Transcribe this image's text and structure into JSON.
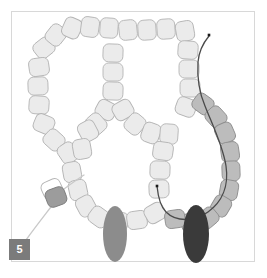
{
  "figure": {
    "step_label": "5",
    "canvas": {
      "width": 267,
      "height": 278
    },
    "frame": {
      "name": "panel-border",
      "x": 11,
      "y": 11,
      "width": 244,
      "height": 251,
      "stroke": "#d8d8d8",
      "fill": "#ffffff"
    },
    "colors": {
      "background": "#ffffff",
      "bead_light_fill": "#ebebeb",
      "bead_light_stroke": "#b4b4b4",
      "bead_medium_fill": "#bcbcbc",
      "bead_medium_stroke": "#8f8f8f",
      "bead_accent_fill": "#9c9c9c",
      "bead_accent_stroke": "#7d7d7d",
      "oval_light_fill": "#8c8c8c",
      "oval_dark_fill": "#3a3a3a",
      "thread_dark": "#4a4a4a",
      "thread_light": "#c9c9c9",
      "needle_tip": "#1a1a1a",
      "badge_background": "#7b7b7b",
      "badge_text": "#ffffff",
      "frame_border": "#d8d8d8"
    },
    "beads_light": [
      {
        "cx": 44,
        "cy": 48,
        "rx": 10,
        "ry": 9,
        "rot": -38
      },
      {
        "cx": 39,
        "cy": 67,
        "rx": 10,
        "ry": 9,
        "rot": -8
      },
      {
        "cx": 38,
        "cy": 86,
        "rx": 10,
        "ry": 9,
        "rot": -2
      },
      {
        "cx": 39,
        "cy": 105,
        "rx": 10,
        "ry": 9,
        "rot": 4
      },
      {
        "cx": 44,
        "cy": 124,
        "rx": 10,
        "ry": 9,
        "rot": 22
      },
      {
        "cx": 54,
        "cy": 140,
        "rx": 10,
        "ry": 9,
        "rot": 42
      },
      {
        "cx": 68,
        "cy": 153,
        "rx": 10,
        "ry": 9,
        "rot": 56
      },
      {
        "cx": 72,
        "cy": 172,
        "rx": 10,
        "ry": 9,
        "rot": 80
      },
      {
        "cx": 78,
        "cy": 190,
        "rx": 10,
        "ry": 9,
        "rot": 78
      },
      {
        "cx": 86,
        "cy": 206,
        "rx": 10,
        "ry": 9,
        "rot": 62
      },
      {
        "cx": 99,
        "cy": 217,
        "rx": 10,
        "ry": 9,
        "rot": 36
      },
      {
        "cx": 118,
        "cy": 221,
        "rx": 10,
        "ry": 9,
        "rot": 8
      },
      {
        "cx": 137,
        "cy": 220,
        "rx": 10,
        "ry": 9,
        "rot": -8
      },
      {
        "cx": 155,
        "cy": 213,
        "rx": 10,
        "ry": 9,
        "rot": -30
      },
      {
        "cx": 56,
        "cy": 35,
        "rx": 10,
        "ry": 9,
        "rot": -52
      },
      {
        "cx": 72,
        "cy": 28,
        "rx": 10,
        "ry": 9,
        "rot": -66
      },
      {
        "cx": 90,
        "cy": 27,
        "rx": 10,
        "ry": 9,
        "rot": -82
      },
      {
        "cx": 109,
        "cy": 28,
        "rx": 10,
        "ry": 9,
        "rot": -86
      },
      {
        "cx": 128,
        "cy": 30,
        "rx": 10,
        "ry": 9,
        "rot": 84
      },
      {
        "cx": 147,
        "cy": 30,
        "rx": 10,
        "ry": 9,
        "rot": 86
      },
      {
        "cx": 166,
        "cy": 29,
        "rx": 10,
        "ry": 9,
        "rot": 86
      },
      {
        "cx": 185,
        "cy": 31,
        "rx": 10,
        "ry": 9,
        "rot": 80
      },
      {
        "cx": 113,
        "cy": 53,
        "rx": 10,
        "ry": 9,
        "rot": 2
      },
      {
        "cx": 113,
        "cy": 72,
        "rx": 10,
        "ry": 9,
        "rot": 0
      },
      {
        "cx": 113,
        "cy": 91,
        "rx": 10,
        "ry": 9,
        "rot": 2
      },
      {
        "cx": 106,
        "cy": 110,
        "rx": 10,
        "ry": 9,
        "rot": 28
      },
      {
        "cx": 96,
        "cy": 124,
        "rx": 10,
        "ry": 9,
        "rot": 48
      },
      {
        "cx": 123,
        "cy": 110,
        "rx": 10,
        "ry": 9,
        "rot": -30
      },
      {
        "cx": 135,
        "cy": 124,
        "rx": 10,
        "ry": 9,
        "rot": -50
      },
      {
        "cx": 151,
        "cy": 133,
        "rx": 10,
        "ry": 9,
        "rot": -70
      },
      {
        "cx": 169,
        "cy": 134,
        "rx": 10,
        "ry": 9,
        "rot": -86
      },
      {
        "cx": 163,
        "cy": 151,
        "rx": 10,
        "ry": 9,
        "rot": 8
      },
      {
        "cx": 160,
        "cy": 170,
        "rx": 10,
        "ry": 9,
        "rot": 2
      },
      {
        "cx": 159,
        "cy": 189,
        "rx": 10,
        "ry": 9,
        "rot": -2
      },
      {
        "cx": 88,
        "cy": 131,
        "rx": 10,
        "ry": 9,
        "rot": 62
      },
      {
        "cx": 82,
        "cy": 149,
        "rx": 10,
        "ry": 9,
        "rot": 80
      },
      {
        "cx": 188,
        "cy": 50,
        "rx": 10,
        "ry": 9,
        "rot": 4
      },
      {
        "cx": 189,
        "cy": 69,
        "rx": 10,
        "ry": 9,
        "rot": 0
      },
      {
        "cx": 190,
        "cy": 88,
        "rx": 10,
        "ry": 9,
        "rot": 0
      },
      {
        "cx": 186,
        "cy": 107,
        "rx": 10,
        "ry": 9,
        "rot": 20
      }
    ],
    "beads_medium": [
      {
        "cx": 203,
        "cy": 104,
        "rx": 10,
        "ry": 9,
        "rot": 36
      },
      {
        "cx": 216,
        "cy": 117,
        "rx": 10,
        "ry": 9,
        "rot": 48
      },
      {
        "cx": 225,
        "cy": 133,
        "rx": 10,
        "ry": 9,
        "rot": 66
      },
      {
        "cx": 230,
        "cy": 152,
        "rx": 10,
        "ry": 9,
        "rot": 82
      },
      {
        "cx": 231,
        "cy": 171,
        "rx": 10,
        "ry": 9,
        "rot": 88
      },
      {
        "cx": 229,
        "cy": 190,
        "rx": 10,
        "ry": 9,
        "rot": -80
      },
      {
        "cx": 221,
        "cy": 206,
        "rx": 10,
        "ry": 9,
        "rot": -60
      },
      {
        "cx": 208,
        "cy": 218,
        "rx": 10,
        "ry": 9,
        "rot": -40
      },
      {
        "cx": 191,
        "cy": 222,
        "rx": 10,
        "ry": 9,
        "rot": -16
      },
      {
        "cx": 175,
        "cy": 219,
        "rx": 10,
        "ry": 9,
        "rot": -8
      }
    ],
    "bead_tail": {
      "cx": 56,
      "cy": 197,
      "rx": 10,
      "ry": 9,
      "rot": -20
    },
    "bead_tail_outline": {
      "cx": 52,
      "cy": 189,
      "rx": 10,
      "ry": 9,
      "rot": -24
    },
    "ovals": [
      {
        "name": "oval-bead-left",
        "cx": 115,
        "cy": 234,
        "rx": 12,
        "ry": 28,
        "fill": "#8c8c8c"
      },
      {
        "name": "oval-bead-right",
        "cx": 196,
        "cy": 234,
        "rx": 13,
        "ry": 29,
        "fill": "#3a3a3a"
      }
    ],
    "threads": [
      {
        "name": "needle-thread-path",
        "d": "M 209 36 C 204 42, 199 50, 198 62 C 197 78, 199 92, 205 106 C 212 124, 223 146, 226 166 C 229 186, 222 202, 208 212 C 194 222, 176 222, 166 212 C 160 206, 158 196, 157 186",
        "stroke": "#4a4a4a",
        "width": 1.3
      },
      {
        "name": "tail-thread-path",
        "d": "M 57 199 C 48 211, 36 226, 26 240 C 22 245, 20 249, 19 253",
        "stroke": "#c9c9c9",
        "width": 1.3
      },
      {
        "name": "tail-thread-upper",
        "d": "M 60 192 C 68 186, 76 180, 84 175",
        "stroke": "#c9c9c9",
        "width": 1.3
      }
    ],
    "needle_tips": [
      {
        "name": "needle-tip-top",
        "cx": 209,
        "cy": 35,
        "size": 2.6
      },
      {
        "name": "needle-tip-lower",
        "cx": 157,
        "cy": 186,
        "size": 2.6
      }
    ]
  }
}
